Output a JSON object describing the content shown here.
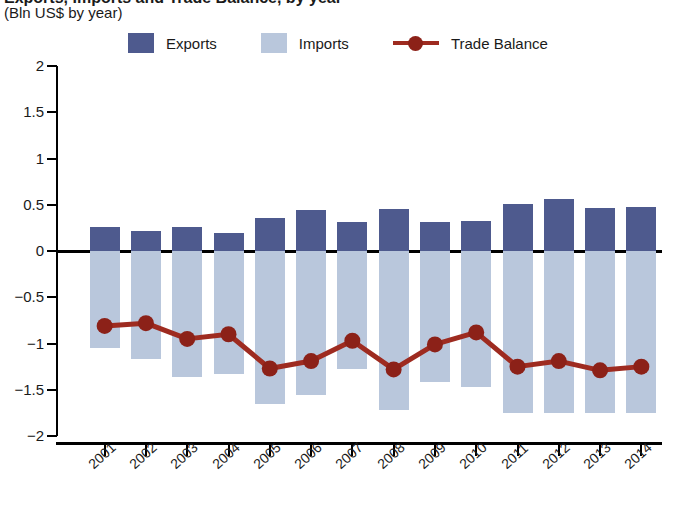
{
  "header": {
    "title": "Exports, Imports and Trade Balance, by year",
    "subtitle": "(Bln US$ by year)"
  },
  "legend": {
    "items": [
      {
        "label": "Exports",
        "marker": "square-swatch",
        "color": "#4e5a8e"
      },
      {
        "label": "Imports",
        "marker": "square-swatch",
        "color": "#b9c7dc"
      },
      {
        "label": "Trade Balance",
        "marker": "line-with-dot",
        "color": "#9e2b20"
      }
    ]
  },
  "axes": {
    "y_ticks": [
      "2",
      "1.5",
      "1",
      "0.5",
      "0",
      "−0.5",
      "−1",
      "−1.5",
      "−2"
    ],
    "y_values": [
      2,
      1.5,
      1,
      0.5,
      0,
      -0.5,
      -1,
      -1.5,
      -2
    ],
    "x_ticks": [
      "2001",
      "2002",
      "2003",
      "2004",
      "2005",
      "2006",
      "2007",
      "2008",
      "2009",
      "2010",
      "2011",
      "2012",
      "2013",
      "2014"
    ]
  },
  "colors": {
    "exports": "#4e5a8e",
    "imports": "#b9c7dc",
    "trade_balance": "#9e2b20",
    "trade_balance_dot": "#8c2118",
    "axis": "#000000",
    "background": "#ffffff"
  },
  "chart_data": {
    "type": "bar",
    "title": "Exports, Imports and Trade Balance, by year",
    "subtitle": "(Bln US$ by year)",
    "xlabel": "",
    "ylabel": "Bln US$",
    "ylim": [
      -2,
      2
    ],
    "grid": false,
    "legend_position": "top",
    "categories": [
      "2001",
      "2002",
      "2003",
      "2004",
      "2005",
      "2006",
      "2007",
      "2008",
      "2009",
      "2010",
      "2011",
      "2012",
      "2013",
      "2014"
    ],
    "series": [
      {
        "name": "Exports",
        "type": "bar",
        "color": "#4e5a8e",
        "values": [
          0.26,
          0.22,
          0.26,
          0.2,
          0.36,
          0.44,
          0.31,
          0.45,
          0.31,
          0.32,
          0.51,
          0.56,
          0.47,
          0.48
        ]
      },
      {
        "name": "Imports",
        "type": "bar",
        "color": "#b9c7dc",
        "values": [
          -1.05,
          -1.17,
          -1.36,
          -1.33,
          -1.65,
          -1.56,
          -1.28,
          -1.72,
          -1.42,
          -1.47,
          -1.75,
          -1.75,
          -1.75,
          -1.75
        ]
      },
      {
        "name": "Trade Balance",
        "type": "line",
        "color": "#9e2b20",
        "values": [
          -0.81,
          -0.78,
          -0.95,
          -0.9,
          -1.27,
          -1.19,
          -0.97,
          -1.28,
          -1.01,
          -0.88,
          -1.25,
          -1.19,
          -1.29,
          -1.25
        ]
      }
    ]
  }
}
